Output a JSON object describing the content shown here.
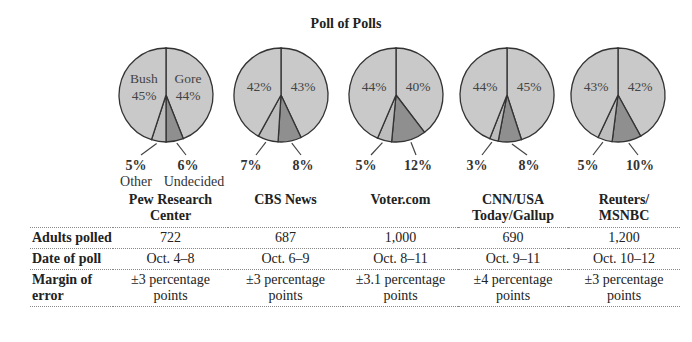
{
  "title": "Poll of Polls",
  "chart_data": {
    "type": "pie",
    "title": "Poll of Polls",
    "legend": [
      "Bush",
      "Gore",
      "Undecided",
      "Other"
    ],
    "pies": [
      {
        "source": "Pew Research Center",
        "Bush": 45,
        "Gore": 44,
        "Undecided": 6,
        "Other": 5
      },
      {
        "source": "CBS News",
        "Bush": 42,
        "Gore": 43,
        "Undecided": 8,
        "Other": 7
      },
      {
        "source": "Voter.com",
        "Bush": 44,
        "Gore": 40,
        "Undecided": 12,
        "Other": 5
      },
      {
        "source": "CNN/USA Today/Gallup",
        "Bush": 44,
        "Gore": 45,
        "Undecided": 8,
        "Other": 3
      },
      {
        "source": "Reuters/MSNBC",
        "Bush": 43,
        "Gore": 42,
        "Undecided": 10,
        "Other": 5
      }
    ],
    "colors": {
      "Bush": "#c9c9c9",
      "Gore": "#c9c9c9",
      "Other": "#bdbdbd",
      "Undecided": "#8f8f8f",
      "outline": "#333333"
    }
  },
  "pies": [
    {
      "left_label": "45%",
      "right_label": "44%",
      "left_name": "Bush",
      "right_name": "Gore",
      "other": "5%",
      "undecided": "6%",
      "other_name": "Other",
      "undecided_name": "Undecided"
    },
    {
      "left_label": "42%",
      "right_label": "43%",
      "other": "7%",
      "undecided": "8%"
    },
    {
      "left_label": "44%",
      "right_label": "40%",
      "other": "5%",
      "undecided": "12%"
    },
    {
      "left_label": "44%",
      "right_label": "45%",
      "other": "3%",
      "undecided": "8%"
    },
    {
      "left_label": "43%",
      "right_label": "42%",
      "other": "5%",
      "undecided": "10%"
    }
  ],
  "table": {
    "columns": [
      {
        "line1": "Pew Research",
        "line2": "Center"
      },
      {
        "line1": "CBS News",
        "line2": ""
      },
      {
        "line1": "Voter.com",
        "line2": ""
      },
      {
        "line1": "CNN/USA",
        "line2": "Today/Gallup"
      },
      {
        "line1": "Reuters/",
        "line2": "MSNBC"
      }
    ],
    "rows": [
      {
        "label1": "Adults polled",
        "label2": "",
        "cells": [
          {
            "l1": "722",
            "l2": ""
          },
          {
            "l1": "687",
            "l2": ""
          },
          {
            "l1": "1,000",
            "l2": ""
          },
          {
            "l1": "690",
            "l2": ""
          },
          {
            "l1": "1,200",
            "l2": ""
          }
        ]
      },
      {
        "label1": "Date of poll",
        "label2": "",
        "cells": [
          {
            "l1": "Oct. 4–8",
            "l2": ""
          },
          {
            "l1": "Oct. 6–9",
            "l2": ""
          },
          {
            "l1": "Oct. 8–11",
            "l2": ""
          },
          {
            "l1": "Oct. 9–11",
            "l2": ""
          },
          {
            "l1": "Oct. 10–12",
            "l2": ""
          }
        ]
      },
      {
        "label1": "Margin of",
        "label2": "error",
        "cells": [
          {
            "l1": "±3 percentage",
            "l2": "points"
          },
          {
            "l1": "±3 percentage",
            "l2": "points"
          },
          {
            "l1": "±3.1 percentage",
            "l2": "points"
          },
          {
            "l1": "±4 percentage",
            "l2": "points"
          },
          {
            "l1": "±3 percentage",
            "l2": "points"
          }
        ]
      }
    ]
  }
}
